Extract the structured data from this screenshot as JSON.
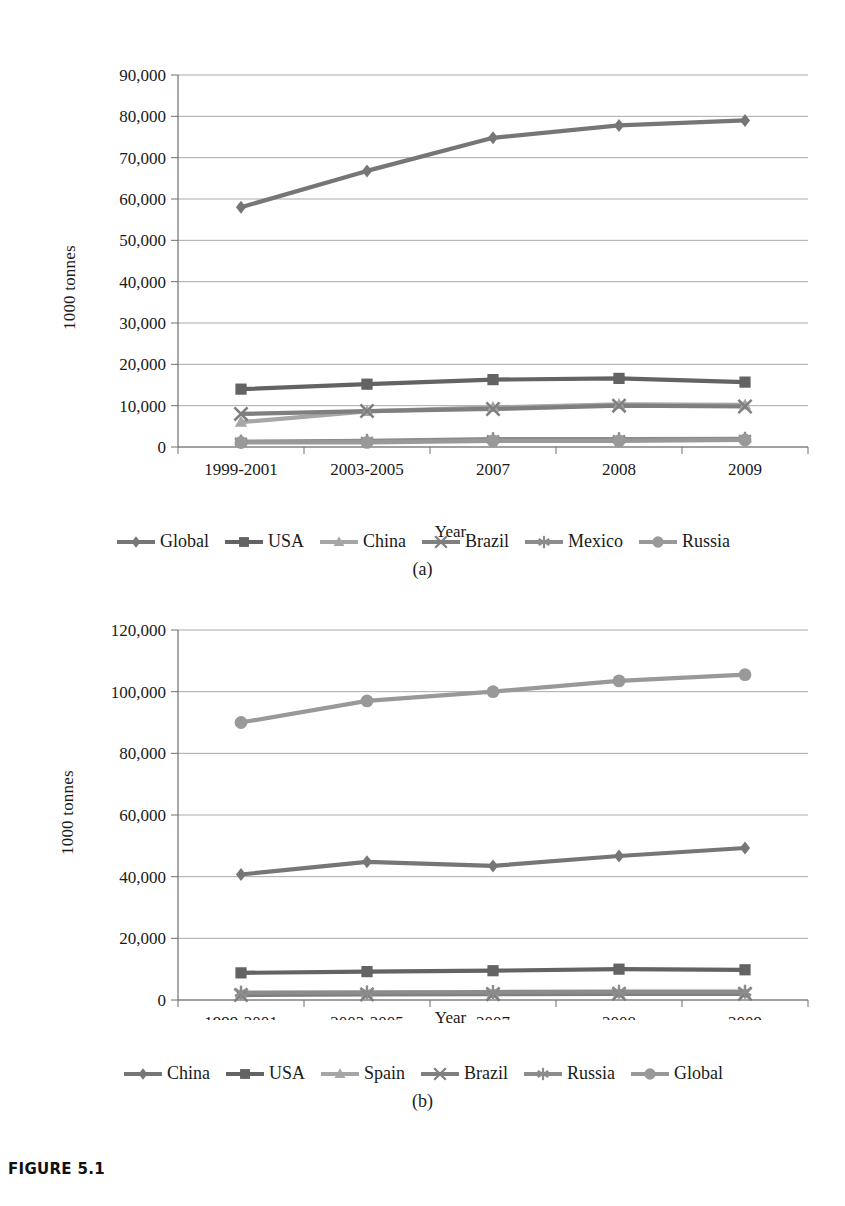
{
  "figure": {
    "caption": "FIGURE 5.1",
    "subcaption_a": "(a)",
    "subcaption_b": "(b)"
  },
  "chart_data": [
    {
      "id": "a",
      "type": "line",
      "title": "",
      "xlabel": "Year",
      "ylabel": "1000 tonnes",
      "categories": [
        "1999-2001",
        "2003-2005",
        "2007",
        "2008",
        "2009"
      ],
      "ylim": [
        0,
        90000
      ],
      "ytick_step": 10000,
      "yticks": [
        "0",
        "10,000",
        "20,000",
        "30,000",
        "40,000",
        "50,000",
        "60,000",
        "70,000",
        "80,000",
        "90,000"
      ],
      "grid": true,
      "legend_position": "bottom",
      "series": [
        {
          "name": "Global",
          "marker": "diamond",
          "color": "#767676",
          "values": [
            58000,
            66800,
            74800,
            77800,
            79000
          ]
        },
        {
          "name": "USA",
          "marker": "square",
          "color": "#636363",
          "values": [
            14000,
            15200,
            16300,
            16600,
            15700
          ]
        },
        {
          "name": "China",
          "marker": "triangle",
          "color": "#a6a6a6",
          "values": [
            6000,
            8600,
            9600,
            10300,
            10200
          ]
        },
        {
          "name": "Brazil",
          "marker": "cross",
          "color": "#7f7f7f",
          "values": [
            8000,
            8700,
            9200,
            10000,
            9800
          ]
        },
        {
          "name": "Mexico",
          "marker": "asterisk",
          "color": "#8c8c8c",
          "values": [
            1300,
            1500,
            1900,
            1900,
            2000
          ]
        },
        {
          "name": "Russia",
          "marker": "circle",
          "color": "#999999",
          "values": [
            1100,
            1100,
            1500,
            1500,
            1700
          ]
        }
      ]
    },
    {
      "id": "b",
      "type": "line",
      "title": "",
      "xlabel": "Year",
      "ylabel": "1000 tonnes",
      "categories": [
        "1999-2001",
        "2003-2005",
        "2007",
        "2008",
        "2009"
      ],
      "ylim": [
        0,
        120000
      ],
      "ytick_step": 20000,
      "yticks": [
        "0",
        "20,000",
        "40,000",
        "60,000",
        "80,000",
        "100,000",
        "120,000"
      ],
      "grid": true,
      "legend_position": "bottom",
      "series": [
        {
          "name": "China",
          "marker": "diamond",
          "color": "#767676",
          "values": [
            40700,
            44800,
            43500,
            46700,
            49300
          ]
        },
        {
          "name": "USA",
          "marker": "square",
          "color": "#636363",
          "values": [
            8800,
            9200,
            9500,
            10000,
            9800
          ]
        },
        {
          "name": "Spain",
          "marker": "triangle",
          "color": "#a6a6a6",
          "values": [
            2000,
            2100,
            2200,
            2300,
            2300
          ]
        },
        {
          "name": "Brazil",
          "marker": "cross",
          "color": "#7f7f7f",
          "values": [
            1600,
            1800,
            1900,
            2000,
            2000
          ]
        },
        {
          "name": "Russia",
          "marker": "asterisk",
          "color": "#8c8c8c",
          "values": [
            2400,
            2500,
            2600,
            2700,
            2700
          ]
        },
        {
          "name": "Global",
          "marker": "circle",
          "color": "#999999",
          "values": [
            90000,
            97000,
            100000,
            103500,
            105500
          ]
        }
      ]
    }
  ]
}
